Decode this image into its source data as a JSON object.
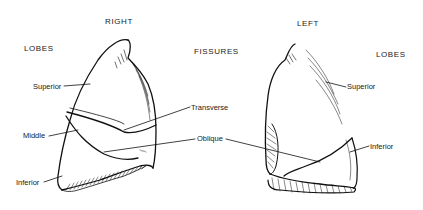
{
  "headings": {
    "right": "RIGHT",
    "left": "LEFT",
    "lobes_left_column": "LOBES",
    "fissures": "FISSURES",
    "lobes_right_column": "LOBES"
  },
  "right_lung": {
    "lobes": [
      {
        "label": "Superior"
      },
      {
        "label": "Middle"
      },
      {
        "label": "Inferior"
      }
    ]
  },
  "fissures": [
    {
      "label": "Transverse"
    },
    {
      "label": "Oblique"
    }
  ],
  "left_lung": {
    "lobes": [
      {
        "label": "Superior"
      },
      {
        "label": "Inferior"
      }
    ]
  },
  "colors": {
    "line": "#111111",
    "background": "#ffffff"
  }
}
